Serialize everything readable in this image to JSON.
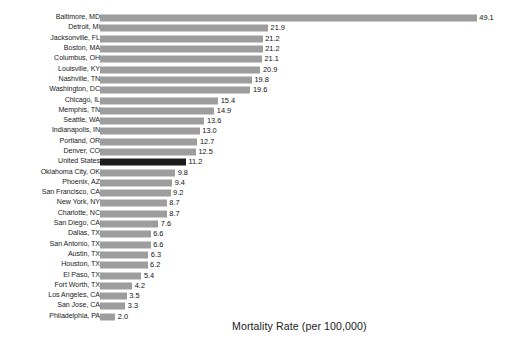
{
  "chart_data": {
    "type": "bar",
    "orientation": "horizontal",
    "title": "",
    "xlabel": "Mortality Rate (per 100,000)",
    "ylabel": "",
    "grid": false,
    "legend": null,
    "xlim": [
      0,
      49.1
    ],
    "value_label_format": "one-decimal",
    "highlight_category": "United States",
    "colors": {
      "bar": "#9d9d9d",
      "highlight_bar": "#1c1c1c",
      "background": "#ffffff",
      "text": "#1a1a1a"
    },
    "categories": [
      "Baltimore, MD",
      "Detroit, Mi",
      "Jacksonville, FL",
      "Boston, MA",
      "Columbus, OH",
      "Louisville, KY",
      "Nashville, TN",
      "Washington, DC",
      "Chicago, IL",
      "Memphis, TN",
      "Seattle, WA",
      "Indianapolis, IN",
      "Portland, OR",
      "Denver, CO",
      "United States",
      "Oklahoma City, OK",
      "Phoenix, AZ",
      "San Francisco, CA",
      "New York, NY",
      "Charlotte, NC",
      "San Diego, CA",
      "Dallas, TX",
      "San Antonio, TX",
      "Austin, TX",
      "Houston, TX",
      "El Paso, TX",
      "Fort Worth, TX",
      "Los Angeles, CA",
      "San Jose, CA",
      "Philadelphia, PA"
    ],
    "values": [
      49.1,
      21.9,
      21.2,
      21.2,
      21.1,
      20.9,
      19.8,
      19.6,
      15.4,
      14.9,
      13.6,
      13.0,
      12.7,
      12.5,
      11.2,
      9.8,
      9.4,
      9.2,
      8.7,
      8.7,
      7.6,
      6.6,
      6.6,
      6.3,
      6.2,
      5.4,
      4.2,
      3.5,
      3.3,
      2.0
    ],
    "value_labels": [
      "49.1",
      "21.9",
      "21.2",
      "21.2",
      "21.1",
      "20.9",
      "19.8",
      "19.6",
      "15.4",
      "14.9",
      "13.6",
      "13.0",
      "12.7",
      "12.5",
      "11.2",
      "9.8",
      "9.4",
      "9.2",
      "8.7",
      "8.7",
      "7.6",
      "6.6",
      "6.6",
      "6.3",
      "6.2",
      "5.4",
      "4.2",
      "3.5",
      "3.3",
      "2.0"
    ]
  }
}
